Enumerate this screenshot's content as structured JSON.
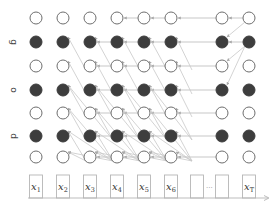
{
  "diagram": {
    "type": "unrolled-recurrent-network",
    "row_labels": [
      {
        "text": "g",
        "row": 1
      },
      {
        "text": "o",
        "row": 3
      },
      {
        "text": "d",
        "row": 5
      }
    ],
    "columns": [
      {
        "x": 36,
        "input": "x",
        "sub": "1"
      },
      {
        "x": 63,
        "input": "x",
        "sub": "2"
      },
      {
        "x": 90,
        "input": "x",
        "sub": "3"
      },
      {
        "x": 117,
        "input": "x",
        "sub": "4"
      },
      {
        "x": 144,
        "input": "x",
        "sub": "5"
      },
      {
        "x": 171,
        "input": "x",
        "sub": "6"
      },
      {
        "x": 222,
        "input": "",
        "sub": ""
      },
      {
        "x": 249,
        "input": "x",
        "sub": "T"
      }
    ],
    "empty_box_x": 197,
    "ellipsis": "...",
    "ellipsis_x": 210,
    "rows_y": [
      18,
      42,
      66,
      90,
      113,
      136,
      157
    ],
    "filled_rows": [
      1,
      3,
      5
    ],
    "colors": {
      "node_filled": "#3d3d3d",
      "node_stroke": "#6e6e6e",
      "edge": "#c8c8c8",
      "box": "#b5b5b5"
    }
  }
}
